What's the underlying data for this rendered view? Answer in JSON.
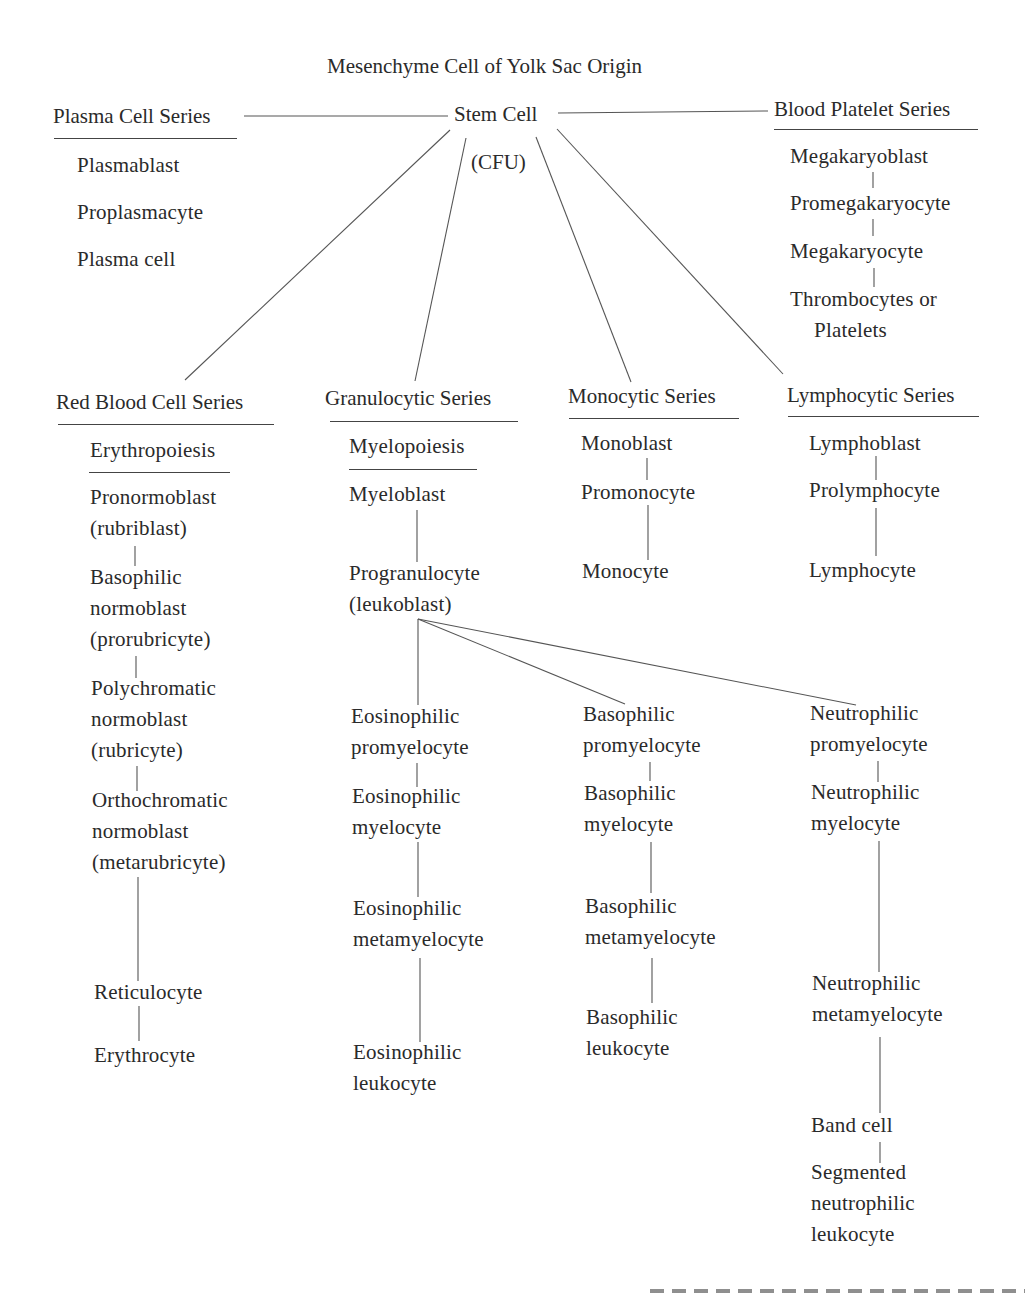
{
  "diagram": {
    "title": "Mesenchyme Cell of Yolk Sac Origin",
    "root": {
      "label": "Stem Cell",
      "sublabel": "(CFU)"
    },
    "series": {
      "plasma": {
        "title": "Plasma Cell Series",
        "stages": [
          "Plasmablast",
          "Proplasmacyte",
          "Plasma cell"
        ]
      },
      "platelet": {
        "title": "Blood Platelet Series",
        "stages": [
          "Megakaryoblast",
          "Promegakaryocyte",
          "Megakaryocyte",
          "Thrombocytes or",
          "Platelets"
        ]
      },
      "red": {
        "title": "Red Blood Cell Series",
        "subtitle": "Erythropoiesis",
        "stages": [
          [
            "Pronormoblast",
            "(rubriblast)"
          ],
          [
            "Basophilic",
            "normoblast",
            "(prorubricyte)"
          ],
          [
            "Polychromatic",
            "normoblast",
            "(rubricyte)"
          ],
          [
            "Orthochromatic",
            "normoblast",
            "(metarubricyte)"
          ],
          [
            "Reticulocyte"
          ],
          [
            "Erythrocyte"
          ]
        ]
      },
      "granulocytic": {
        "title": "Granulocytic Series",
        "subtitle": "Myelopoiesis",
        "stages": [
          [
            "Myeloblast"
          ],
          [
            "Progranulocyte",
            "(leukoblast)"
          ]
        ],
        "branches": {
          "eosinophilic": [
            [
              "Eosinophilic",
              "promyelocyte"
            ],
            [
              "Eosinophilic",
              "myelocyte"
            ],
            [
              "Eosinophilic",
              "metamyelocyte"
            ],
            [
              "Eosinophilic",
              "leukocyte"
            ]
          ],
          "basophilic": [
            [
              "Basophilic",
              "promyelocyte"
            ],
            [
              "Basophilic",
              "myelocyte"
            ],
            [
              "Basophilic",
              "metamyelocyte"
            ],
            [
              "Basophilic",
              "leukocyte"
            ]
          ],
          "neutrophilic": [
            [
              "Neutrophilic",
              "promyelocyte"
            ],
            [
              "Neutrophilic",
              "myelocyte"
            ],
            [
              "Neutrophilic",
              "metamyelocyte"
            ],
            [
              "Band cell"
            ],
            [
              "Segmented",
              "neutrophilic",
              "leukocyte"
            ]
          ]
        }
      },
      "monocytic": {
        "title": "Monocytic Series",
        "stages": [
          "Monoblast",
          "Promonocyte",
          "Monocyte"
        ]
      },
      "lymphocytic": {
        "title": "Lymphocytic Series",
        "stages": [
          "Lymphoblast",
          "Prolymphocyte",
          "Lymphocyte"
        ]
      }
    }
  },
  "colors": {
    "text": "#2a2a2a",
    "lines": "#555555",
    "background": "#ffffff"
  }
}
